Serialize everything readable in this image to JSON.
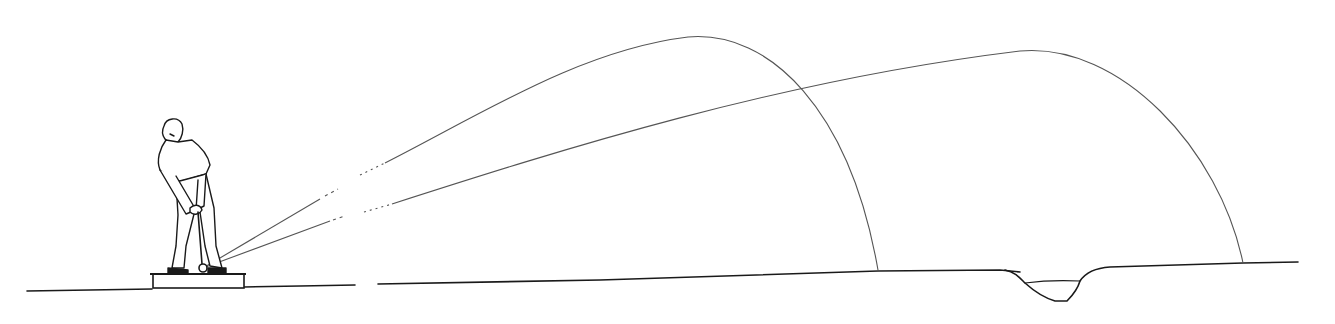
{
  "illustration": {
    "subject": "Golfer hitting two shots with different trajectories",
    "colors": {
      "background": "#ffffff",
      "ink": "#1a1a1a",
      "trajectory": "#555555"
    },
    "shots": [
      {
        "name": "high-shot",
        "launch": [
          203,
          268
        ],
        "apex": [
          688,
          37
        ],
        "landing": [
          878,
          270
        ]
      },
      {
        "name": "low-shot",
        "launch": [
          203,
          268
        ],
        "apex": [
          1020,
          51
        ],
        "landing": [
          1243,
          263
        ]
      }
    ],
    "ground": {
      "start_x": 27,
      "end_x": 1298
    },
    "hazard": {
      "name": "water-hazard",
      "x_range": [
        1000,
        1080
      ]
    }
  }
}
